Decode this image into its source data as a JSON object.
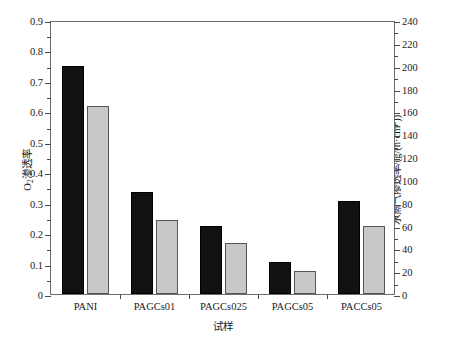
{
  "chart_data": {
    "type": "bar",
    "title": "",
    "categories": [
      "PANI",
      "PAGCs01",
      "PAGCs025",
      "PAGCs05",
      "PACCs05"
    ],
    "series": [
      {
        "name": "O2-permeability",
        "axis": "left",
        "color": "#111111",
        "values": [
          0.75,
          0.335,
          0.225,
          0.105,
          0.305
        ]
      },
      {
        "name": "water-vapor-transmission",
        "axis": "right",
        "color": "#c8c8c8",
        "values": [
          165,
          65,
          45,
          20,
          60
        ]
      }
    ],
    "xlabel": "试样",
    "ylabel_left": "O₂渗透率",
    "ylabel_right": "水蒸气渗透率/(g/(h·cm²))",
    "ylim_left": [
      0,
      0.9
    ],
    "ylim_right": [
      0,
      240
    ],
    "yticks_left": [
      "0",
      "0.1",
      "0.2",
      "0.3",
      "0.4",
      "0.5",
      "0.6",
      "0.7",
      "0.8",
      "0.9"
    ],
    "yticks_right": [
      "0",
      "20",
      "40",
      "60",
      "80",
      "100",
      "120",
      "140",
      "160",
      "180",
      "200",
      "220",
      "240"
    ],
    "grid": false,
    "legend": "none",
    "minor_ticks": true
  },
  "axes": {
    "left_title_parts": {
      "pre": "O",
      "sub": "2",
      "post": "渗透率"
    },
    "right_title_parts": {
      "pre": "水蒸气渗透率/(g/(h·cm",
      "sup": "2",
      "post": "))"
    },
    "x_title": "试样"
  }
}
